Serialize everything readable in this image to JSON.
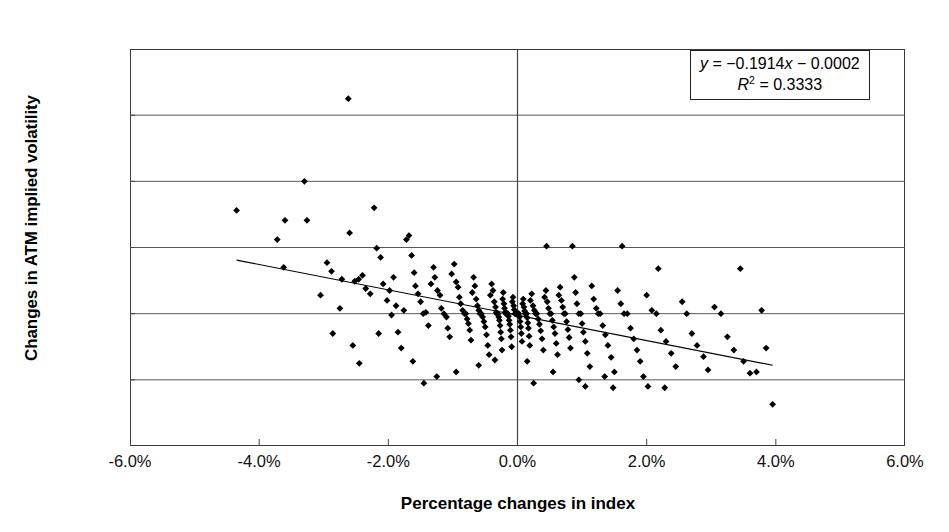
{
  "chart_data": {
    "type": "scatter",
    "title": "",
    "xlabel": "Percentage changes in index",
    "ylabel": "Changes in ATM implied volatility",
    "xlim": [
      -6.0,
      6.0
    ],
    "ylim": [
      -2.0,
      4.0
    ],
    "xticks": [
      -6.0,
      -4.0,
      -2.0,
      0.0,
      2.0,
      4.0,
      6.0
    ],
    "yticks": [
      -2.0,
      -1.0,
      0.0,
      1.0,
      2.0,
      3.0,
      4.0
    ],
    "xtick_labels": [
      "-6.0%",
      "-4.0%",
      "-2.0%",
      "0.0%",
      "2.0%",
      "4.0%",
      "6.0%"
    ],
    "ytick_labels": [
      "-2.0%",
      "-1.0%",
      "0.0%",
      "1.0%",
      "2.0%",
      "3.0%",
      "4.0%"
    ],
    "grid": "horizontal-gridlines-plus-zero-vertical-axis",
    "legend": "none",
    "marker": "filled-diamond",
    "marker_color": "#000000",
    "annotation_equation": "y = −0.1914x − 0.0002",
    "annotation_r2": "R2 = 0.3333",
    "annotation_r2_base": "R",
    "annotation_r2_exp": "2",
    "annotation_r2_value": " = 0.3333",
    "annotation_eq_y": "y",
    "annotation_eq_rest": " = −0.1914",
    "annotation_eq_x": "x",
    "annotation_eq_tail": " − 0.0002",
    "trendline": {
      "slope": -0.1914,
      "intercept": -0.0002,
      "x_start": -4.35,
      "y_start": 0.81,
      "x_end": 3.95,
      "y_end": -0.78
    },
    "points": [
      [
        -4.35,
        1.56
      ],
      [
        -3.72,
        1.12
      ],
      [
        -3.62,
        0.7
      ],
      [
        -3.6,
        1.41
      ],
      [
        -3.3,
        2.0
      ],
      [
        -3.26,
        1.41
      ],
      [
        -2.95,
        0.77
      ],
      [
        -2.88,
        0.64
      ],
      [
        -2.86,
        -0.3
      ],
      [
        -2.62,
        3.25
      ],
      [
        -2.6,
        1.22
      ],
      [
        -2.52,
        0.49
      ],
      [
        -2.46,
        0.52
      ],
      [
        -2.4,
        0.58
      ],
      [
        -2.35,
        0.38
      ],
      [
        -2.28,
        0.3
      ],
      [
        -2.22,
        1.6
      ],
      [
        -2.18,
        0.99
      ],
      [
        -2.12,
        0.85
      ],
      [
        -2.08,
        0.45
      ],
      [
        -2.02,
        0.2
      ],
      [
        -1.98,
        0.35
      ],
      [
        -1.95,
        -0.02
      ],
      [
        -1.92,
        0.55
      ],
      [
        -1.88,
        0.12
      ],
      [
        -1.85,
        -0.28
      ],
      [
        -1.8,
        -0.52
      ],
      [
        -1.76,
        0.05
      ],
      [
        -1.72,
        1.12
      ],
      [
        -1.68,
        1.18
      ],
      [
        -1.64,
        0.88
      ],
      [
        -1.6,
        0.62
      ],
      [
        -1.58,
        0.42
      ],
      [
        -1.54,
        0.3
      ],
      [
        -1.5,
        0.18
      ],
      [
        -1.46,
        0.0
      ],
      [
        -1.42,
        0.02
      ],
      [
        -1.38,
        -0.18
      ],
      [
        -1.34,
        0.45
      ],
      [
        -1.3,
        0.7
      ],
      [
        -1.28,
        0.55
      ],
      [
        -1.24,
        0.35
      ],
      [
        -1.2,
        0.28
      ],
      [
        -1.18,
        0.08
      ],
      [
        -1.14,
        0.0
      ],
      [
        -1.1,
        -0.05
      ],
      [
        -1.08,
        -0.22
      ],
      [
        -1.05,
        -0.35
      ],
      [
        -1.02,
        0.6
      ],
      [
        -0.98,
        0.75
      ],
      [
        -0.95,
        0.48
      ],
      [
        -0.92,
        0.4
      ],
      [
        -0.9,
        0.25
      ],
      [
        -0.88,
        0.15
      ],
      [
        -0.85,
        0.05
      ],
      [
        -0.82,
        0.0
      ],
      [
        -0.8,
        0.0
      ],
      [
        -0.78,
        -0.08
      ],
      [
        -0.76,
        -0.15
      ],
      [
        -0.74,
        -0.25
      ],
      [
        -0.72,
        -0.4
      ],
      [
        -0.7,
        0.32
      ],
      [
        -0.68,
        0.55
      ],
      [
        -0.66,
        0.42
      ],
      [
        -0.64,
        0.22
      ],
      [
        -0.62,
        0.12
      ],
      [
        -0.6,
        0.05
      ],
      [
        -0.58,
        0.0
      ],
      [
        -0.56,
        0.0
      ],
      [
        -0.54,
        -0.05
      ],
      [
        -0.52,
        -0.12
      ],
      [
        -0.5,
        -0.2
      ],
      [
        -0.48,
        -0.32
      ],
      [
        -0.46,
        -0.48
      ],
      [
        -0.44,
        -0.62
      ],
      [
        -0.42,
        0.28
      ],
      [
        -0.4,
        0.45
      ],
      [
        -0.38,
        0.35
      ],
      [
        -0.36,
        0.18
      ],
      [
        -0.34,
        0.1
      ],
      [
        -0.33,
        0.02
      ],
      [
        -0.32,
        0.0
      ],
      [
        -0.31,
        0.0
      ],
      [
        -0.3,
        0.0
      ],
      [
        -0.29,
        -0.05
      ],
      [
        -0.28,
        -0.1
      ],
      [
        -0.27,
        -0.18
      ],
      [
        -0.26,
        -0.28
      ],
      [
        -0.25,
        -0.38
      ],
      [
        -0.24,
        -0.55
      ],
      [
        -0.23,
        0.22
      ],
      [
        -0.22,
        0.32
      ],
      [
        -0.21,
        0.15
      ],
      [
        -0.2,
        0.08
      ],
      [
        -0.19,
        0.02
      ],
      [
        -0.18,
        0.0
      ],
      [
        -0.17,
        0.0
      ],
      [
        -0.16,
        0.0
      ],
      [
        -0.15,
        0.0
      ],
      [
        -0.14,
        -0.04
      ],
      [
        -0.13,
        -0.1
      ],
      [
        -0.12,
        -0.16
      ],
      [
        -0.11,
        -0.25
      ],
      [
        -0.1,
        -0.35
      ],
      [
        -0.09,
        -0.5
      ],
      [
        -0.08,
        0.18
      ],
      [
        -0.07,
        0.25
      ],
      [
        -0.06,
        0.12
      ],
      [
        -0.05,
        0.06
      ],
      [
        -0.04,
        0.0
      ],
      [
        -0.03,
        0.0
      ],
      [
        -0.02,
        0.0
      ],
      [
        -0.01,
        0.0
      ],
      [
        0.0,
        0.0
      ],
      [
        0.01,
        0.0
      ],
      [
        0.02,
        0.0
      ],
      [
        0.03,
        -0.05
      ],
      [
        0.04,
        -0.12
      ],
      [
        0.05,
        -0.2
      ],
      [
        0.06,
        -0.3
      ],
      [
        0.07,
        -0.42
      ],
      [
        0.08,
        0.15
      ],
      [
        0.09,
        0.22
      ],
      [
        0.1,
        0.1
      ],
      [
        0.11,
        0.04
      ],
      [
        0.12,
        0.0
      ],
      [
        0.13,
        0.0
      ],
      [
        0.14,
        0.0
      ],
      [
        0.15,
        -0.06
      ],
      [
        0.16,
        -0.14
      ],
      [
        0.17,
        -0.22
      ],
      [
        0.18,
        -0.34
      ],
      [
        0.19,
        -0.48
      ],
      [
        0.2,
        0.2
      ],
      [
        0.22,
        0.3
      ],
      [
        0.24,
        0.12
      ],
      [
        0.26,
        0.05
      ],
      [
        0.28,
        0.0
      ],
      [
        0.3,
        0.0
      ],
      [
        0.32,
        -0.08
      ],
      [
        0.34,
        -0.16
      ],
      [
        0.36,
        -0.26
      ],
      [
        0.38,
        -0.38
      ],
      [
        0.4,
        -0.55
      ],
      [
        0.42,
        0.25
      ],
      [
        0.44,
        0.35
      ],
      [
        0.46,
        0.18
      ],
      [
        0.48,
        0.08
      ],
      [
        0.5,
        0.0
      ],
      [
        0.52,
        0.0
      ],
      [
        0.54,
        -0.1
      ],
      [
        0.56,
        -0.2
      ],
      [
        0.58,
        -0.3
      ],
      [
        0.6,
        -0.45
      ],
      [
        0.62,
        -0.62
      ],
      [
        0.64,
        0.28
      ],
      [
        0.66,
        0.4
      ],
      [
        0.68,
        0.2
      ],
      [
        0.7,
        0.1
      ],
      [
        0.72,
        0.0
      ],
      [
        0.74,
        0.0
      ],
      [
        0.76,
        -0.12
      ],
      [
        0.78,
        -0.24
      ],
      [
        0.8,
        -0.36
      ],
      [
        0.82,
        -0.52
      ],
      [
        0.85,
        1.02
      ],
      [
        0.88,
        0.55
      ],
      [
        0.9,
        0.32
      ],
      [
        0.92,
        0.15
      ],
      [
        0.95,
        0.0
      ],
      [
        0.98,
        0.0
      ],
      [
        1.0,
        -0.15
      ],
      [
        1.02,
        -0.28
      ],
      [
        1.05,
        -0.42
      ],
      [
        1.08,
        -0.6
      ],
      [
        1.12,
        -0.8
      ],
      [
        1.15,
        0.42
      ],
      [
        1.18,
        0.22
      ],
      [
        1.22,
        0.08
      ],
      [
        1.25,
        0.0
      ],
      [
        1.28,
        0.0
      ],
      [
        1.32,
        -0.18
      ],
      [
        1.36,
        -0.32
      ],
      [
        1.4,
        -0.48
      ],
      [
        1.45,
        -0.66
      ],
      [
        1.5,
        -0.88
      ],
      [
        1.55,
        0.35
      ],
      [
        1.6,
        0.15
      ],
      [
        1.65,
        0.0
      ],
      [
        1.7,
        0.0
      ],
      [
        1.75,
        -0.22
      ],
      [
        1.8,
        -0.38
      ],
      [
        1.85,
        -0.55
      ],
      [
        1.9,
        -0.72
      ],
      [
        1.95,
        -0.95
      ],
      [
        2.0,
        0.28
      ],
      [
        2.08,
        0.05
      ],
      [
        2.15,
        0.0
      ],
      [
        2.22,
        -0.25
      ],
      [
        2.3,
        -0.42
      ],
      [
        2.38,
        -0.6
      ],
      [
        2.45,
        -0.8
      ],
      [
        2.55,
        0.18
      ],
      [
        2.62,
        0.0
      ],
      [
        2.7,
        -0.3
      ],
      [
        2.78,
        -0.48
      ],
      [
        2.88,
        -0.65
      ],
      [
        2.95,
        -0.85
      ],
      [
        3.05,
        0.1
      ],
      [
        3.15,
        0.0
      ],
      [
        3.25,
        -0.35
      ],
      [
        3.35,
        -0.55
      ],
      [
        3.45,
        0.68
      ],
      [
        3.5,
        -0.72
      ],
      [
        3.6,
        -0.9
      ],
      [
        3.7,
        -0.88
      ],
      [
        3.78,
        0.05
      ],
      [
        3.85,
        -0.52
      ],
      [
        3.95,
        -1.37
      ],
      [
        -2.72,
        0.52
      ],
      [
        -2.55,
        -0.48
      ],
      [
        -2.45,
        -0.75
      ],
      [
        -2.15,
        -0.3
      ],
      [
        -1.62,
        -0.72
      ],
      [
        -1.25,
        -0.95
      ],
      [
        -0.95,
        -0.88
      ],
      [
        -0.6,
        -0.78
      ],
      [
        -0.35,
        -0.7
      ],
      [
        0.15,
        -0.72
      ],
      [
        0.55,
        -0.88
      ],
      [
        0.95,
        -1.0
      ],
      [
        1.35,
        -0.95
      ],
      [
        1.62,
        1.02
      ],
      [
        2.18,
        0.68
      ],
      [
        0.45,
        1.02
      ],
      [
        -3.05,
        0.28
      ],
      [
        -2.75,
        0.08
      ],
      [
        -1.45,
        -1.05
      ],
      [
        0.25,
        -1.05
      ],
      [
        1.05,
        -1.1
      ],
      [
        1.48,
        -1.12
      ],
      [
        2.02,
        -1.1
      ],
      [
        2.28,
        -1.12
      ]
    ]
  }
}
